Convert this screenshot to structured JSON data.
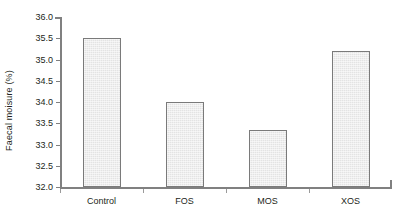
{
  "chart_data": {
    "type": "bar",
    "title": "",
    "subtitle": "",
    "xlabel": "",
    "ylabel": "Faecal moisure (%)",
    "categories": [
      "Control",
      "FOS",
      "MOS",
      "XOS"
    ],
    "values": [
      35.5,
      34.0,
      33.35,
      35.2
    ],
    "series": [
      {
        "name": "Faecal moisture",
        "values": [
          35.5,
          34.0,
          33.35,
          35.2
        ]
      }
    ],
    "ylim": [
      32.0,
      36.0
    ],
    "ytick_step": 0.5,
    "ytick_labels": [
      "36.0",
      "35.5",
      "35.0",
      "34.5",
      "34.0",
      "33.5",
      "33.0",
      "32.5",
      "32.0"
    ],
    "ytick_values": [
      36.0,
      35.5,
      35.0,
      34.5,
      34.0,
      33.5,
      33.0,
      32.5,
      32.0
    ],
    "grid": false,
    "legend": false,
    "legend_position": "none",
    "annotations": [],
    "colors": {
      "bar_fill": "#e3e3e3",
      "bar_border": "#7a7a7a",
      "axis": "#808080",
      "text": "#231f20",
      "background": "#ffffff"
    }
  }
}
